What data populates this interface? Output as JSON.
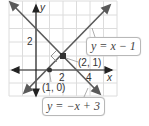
{
  "diagram": {
    "type": "coordinate-graph",
    "axes": {
      "x_label": "x",
      "y_label": "y"
    },
    "tick_labels": {
      "y": [
        "2"
      ],
      "x": [
        "2",
        "4"
      ]
    },
    "lines": [
      {
        "equation": "y = x − 1",
        "color": "#555555"
      },
      {
        "equation": "y = −x + 3",
        "color": "#555555"
      }
    ],
    "points": [
      {
        "label": "(2, 1)",
        "x": 2,
        "y": 1
      },
      {
        "label": "(1, 0)",
        "x": 1,
        "y": 0
      }
    ],
    "right_angle_marker": true
  }
}
